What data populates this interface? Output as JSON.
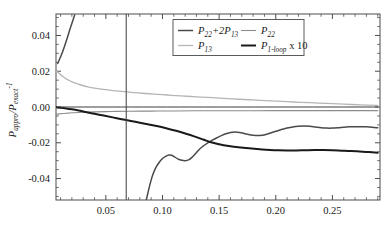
{
  "chart_data": {
    "type": "line",
    "title": "",
    "xlabel": "",
    "ylabel": "P_appro / P_exact^-1",
    "ylabel_parts": {
      "p1": "P",
      "sub1": "appro",
      "slash": "/P",
      "sub2": "exact",
      "sup": "-1"
    },
    "xlim": [
      0.006,
      0.292
    ],
    "ylim": [
      -0.052,
      0.052
    ],
    "grid": false,
    "legend_position": "top-right",
    "xticks": [
      0.05,
      0.1,
      0.15,
      0.2,
      0.25
    ],
    "xtick_labels": [
      "0.05",
      "0.10",
      "0.15",
      "0.20",
      "0.25"
    ],
    "yticks": [
      -0.04,
      -0.02,
      0.0,
      0.02,
      0.04
    ],
    "ytick_labels": [
      "-0.04",
      "-0.02",
      "0.00",
      "0.02",
      "0.04"
    ],
    "x_minor_step": 0.01,
    "y_minor_step": 0.005,
    "vertical_marker_x": 0.068,
    "series": [
      {
        "name": "P22+2P13",
        "label_parts": {
          "p": "P",
          "sub1": "22",
          "plus": "+2",
          "p2": "P",
          "sub2": "13"
        },
        "color": "#4a4a4a",
        "width": 1.5,
        "points": [
          [
            0.0075,
            0.0243
          ],
          [
            0.009,
            0.0265
          ],
          [
            0.011,
            0.0295
          ],
          [
            0.013,
            0.033
          ],
          [
            0.015,
            0.0368
          ],
          [
            0.017,
            0.0408
          ],
          [
            0.019,
            0.0448
          ],
          [
            0.021,
            0.0486
          ],
          [
            0.0225,
            0.0515
          ]
        ]
      },
      {
        "name": "P22+2P13-lower",
        "color": "#4a4a4a",
        "width": 1.5,
        "points": [
          [
            0.0855,
            -0.0525
          ],
          [
            0.0875,
            -0.047
          ],
          [
            0.0895,
            -0.042
          ],
          [
            0.0915,
            -0.0378
          ],
          [
            0.094,
            -0.034
          ],
          [
            0.097,
            -0.031
          ],
          [
            0.1,
            -0.0288
          ],
          [
            0.103,
            -0.0275
          ],
          [
            0.1055,
            -0.0268
          ],
          [
            0.108,
            -0.027
          ],
          [
            0.111,
            -0.028
          ],
          [
            0.114,
            -0.0292
          ],
          [
            0.117,
            -0.0298
          ],
          [
            0.12,
            -0.03
          ],
          [
            0.123,
            -0.0296
          ],
          [
            0.126,
            -0.0282
          ],
          [
            0.129,
            -0.0262
          ],
          [
            0.132,
            -0.024
          ],
          [
            0.136,
            -0.0218
          ],
          [
            0.14,
            -0.02
          ],
          [
            0.144,
            -0.0185
          ],
          [
            0.148,
            -0.0172
          ],
          [
            0.152,
            -0.016
          ],
          [
            0.156,
            -0.015
          ],
          [
            0.16,
            -0.0142
          ],
          [
            0.164,
            -0.014
          ],
          [
            0.168,
            -0.0142
          ],
          [
            0.172,
            -0.0148
          ],
          [
            0.176,
            -0.0154
          ],
          [
            0.18,
            -0.0158
          ],
          [
            0.184,
            -0.016
          ],
          [
            0.188,
            -0.0158
          ],
          [
            0.192,
            -0.0152
          ],
          [
            0.196,
            -0.0144
          ],
          [
            0.2,
            -0.0136
          ],
          [
            0.205,
            -0.0126
          ],
          [
            0.21,
            -0.0118
          ],
          [
            0.215,
            -0.0112
          ],
          [
            0.22,
            -0.0108
          ],
          [
            0.225,
            -0.0106
          ],
          [
            0.23,
            -0.0108
          ],
          [
            0.235,
            -0.0112
          ],
          [
            0.24,
            -0.0116
          ],
          [
            0.245,
            -0.0118
          ],
          [
            0.25,
            -0.0118
          ],
          [
            0.255,
            -0.0116
          ],
          [
            0.26,
            -0.0113
          ],
          [
            0.265,
            -0.0111
          ],
          [
            0.27,
            -0.011
          ],
          [
            0.275,
            -0.011
          ],
          [
            0.28,
            -0.0111
          ],
          [
            0.285,
            -0.0113
          ],
          [
            0.29,
            -0.0116
          ]
        ]
      },
      {
        "name": "P22",
        "label_parts": {
          "p": "P",
          "sub": "22"
        },
        "color": "#8c8c8c",
        "width": 1.1,
        "points": [
          [
            0.0065,
            -0.004
          ],
          [
            0.01,
            -0.0038
          ],
          [
            0.015,
            -0.0035
          ],
          [
            0.02,
            -0.0032
          ],
          [
            0.03,
            -0.0029
          ],
          [
            0.04,
            -0.0027
          ],
          [
            0.055,
            -0.0025
          ],
          [
            0.07,
            -0.0024
          ],
          [
            0.09,
            -0.0023
          ],
          [
            0.11,
            -0.0022
          ],
          [
            0.14,
            -0.0021
          ],
          [
            0.17,
            -0.0021
          ],
          [
            0.2,
            -0.002
          ],
          [
            0.24,
            -0.002
          ],
          [
            0.29,
            -0.002
          ]
        ]
      },
      {
        "name": "P13",
        "label_parts": {
          "p": "P",
          "sub": "13"
        },
        "color": "#b5b5b5",
        "width": 1.3,
        "points": [
          [
            0.0065,
            0.02
          ],
          [
            0.009,
            0.0186
          ],
          [
            0.012,
            0.017
          ],
          [
            0.015,
            0.0157
          ],
          [
            0.019,
            0.0144
          ],
          [
            0.023,
            0.0133
          ],
          [
            0.028,
            0.0123
          ],
          [
            0.034,
            0.0113
          ],
          [
            0.04,
            0.0105
          ],
          [
            0.048,
            0.0098
          ],
          [
            0.056,
            0.0092
          ],
          [
            0.064,
            0.0087
          ],
          [
            0.072,
            0.0082
          ],
          [
            0.082,
            0.0077
          ],
          [
            0.092,
            0.0072
          ],
          [
            0.104,
            0.0067
          ],
          [
            0.116,
            0.0062
          ],
          [
            0.13,
            0.0057
          ],
          [
            0.144,
            0.0052
          ],
          [
            0.158,
            0.0047
          ],
          [
            0.172,
            0.0042
          ],
          [
            0.186,
            0.0037
          ],
          [
            0.2,
            0.0033
          ],
          [
            0.215,
            0.0028
          ],
          [
            0.23,
            0.0024
          ],
          [
            0.245,
            0.002
          ],
          [
            0.26,
            0.0016
          ],
          [
            0.275,
            0.0012
          ],
          [
            0.29,
            0.0009
          ]
        ]
      },
      {
        "name": "P1-loop x 10",
        "label_parts": {
          "p": "P",
          "sub": "1-loop",
          "tail": " x 10"
        },
        "color": "#1a1a1a",
        "width": 2.0,
        "points": [
          [
            0.0065,
            -0.0002
          ],
          [
            0.01,
            -0.0004
          ],
          [
            0.015,
            -0.0008
          ],
          [
            0.02,
            -0.0013
          ],
          [
            0.026,
            -0.002
          ],
          [
            0.032,
            -0.0028
          ],
          [
            0.04,
            -0.0038
          ],
          [
            0.048,
            -0.0048
          ],
          [
            0.056,
            -0.0058
          ],
          [
            0.064,
            -0.0068
          ],
          [
            0.072,
            -0.0078
          ],
          [
            0.08,
            -0.0088
          ],
          [
            0.088,
            -0.0098
          ],
          [
            0.096,
            -0.0108
          ],
          [
            0.104,
            -0.012
          ],
          [
            0.112,
            -0.0133
          ],
          [
            0.12,
            -0.0148
          ],
          [
            0.128,
            -0.0164
          ],
          [
            0.136,
            -0.0182
          ],
          [
            0.142,
            -0.0196
          ],
          [
            0.148,
            -0.0206
          ],
          [
            0.154,
            -0.0214
          ],
          [
            0.16,
            -0.022
          ],
          [
            0.167,
            -0.0225
          ],
          [
            0.174,
            -0.0229
          ],
          [
            0.181,
            -0.0233
          ],
          [
            0.188,
            -0.0237
          ],
          [
            0.195,
            -0.024
          ],
          [
            0.202,
            -0.0242
          ],
          [
            0.21,
            -0.0243
          ],
          [
            0.218,
            -0.0243
          ],
          [
            0.226,
            -0.0242
          ],
          [
            0.234,
            -0.0241
          ],
          [
            0.242,
            -0.0241
          ],
          [
            0.25,
            -0.0242
          ],
          [
            0.258,
            -0.0244
          ],
          [
            0.266,
            -0.0246
          ],
          [
            0.274,
            -0.0249
          ],
          [
            0.282,
            -0.0252
          ],
          [
            0.29,
            -0.0256
          ]
        ]
      },
      {
        "name": "zero-baseline",
        "color": "#3c3c3c",
        "width": 1.0,
        "points": [
          [
            0.0065,
            0.0
          ],
          [
            0.29,
            0.0
          ]
        ]
      }
    ]
  },
  "legend": {
    "entries": [
      {
        "key": "P22+2P13",
        "color": "#4a4a4a"
      },
      {
        "key": "P22",
        "color": "#8c8c8c"
      },
      {
        "key": "P13",
        "color": "#b5b5b5"
      },
      {
        "key": "P1-loop x 10",
        "color": "#1a1a1a"
      }
    ]
  }
}
